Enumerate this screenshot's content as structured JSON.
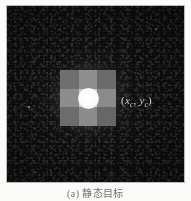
{
  "figure": {
    "type": "grayscale-sensor-image",
    "background_color": "#0b0b0c",
    "frame_border_color": "#b9b9b5",
    "page_color": "#fbfbfa"
  },
  "target": {
    "label_open_paren": "(",
    "label_x_symbol": "x",
    "label_x_subscript": "c",
    "label_comma": ", ",
    "label_y_symbol": "y",
    "label_y_subscript": "c",
    "label_close_paren": ")",
    "label_full": "(xc , yc)",
    "label_color": "#d8d8d8",
    "core_color": "#ffffff",
    "grid_rows": 3,
    "grid_cols": 3,
    "grid_cell_values": [
      [
        "#6f6f6f",
        "#8e8e8e",
        "#6b6b6b"
      ],
      [
        "#8d8d8d",
        "#c9c9c9",
        "#8a8a8a"
      ],
      [
        "#6c6c6c",
        "#8b8b8b",
        "#676767"
      ]
    ]
  },
  "caption": {
    "index": "(a)",
    "text": "(a) 静态目标"
  }
}
